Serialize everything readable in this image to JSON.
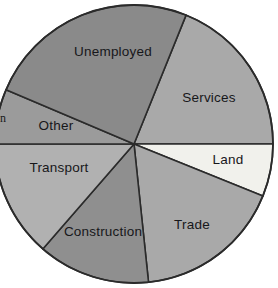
{
  "chart_data": {
    "type": "pie",
    "title": "",
    "subtitle": "",
    "xlabel": "",
    "ylabel": "",
    "legend_position": "none",
    "grid": false,
    "labels_on_slices": true,
    "categories": [
      "Services",
      "Land",
      "Trade",
      "Construction",
      "Transport",
      "Other",
      "Unemployed"
    ],
    "values": [
      19,
      6,
      17,
      13,
      14,
      6,
      25
    ],
    "units": "percent",
    "slices": [
      {
        "label": "Services",
        "value": 19,
        "color": "#a9a9a9",
        "start_angle_deg": -68,
        "end_angle_deg": 0,
        "label_x": 209,
        "label_y": 98
      },
      {
        "label": "Land",
        "value": 6,
        "color": "#f1f1ec",
        "start_angle_deg": 0,
        "end_angle_deg": 22,
        "label_x": 228,
        "label_y": 160
      },
      {
        "label": "Trade",
        "value": 17,
        "color": "#a9a9a9",
        "start_angle_deg": 22,
        "end_angle_deg": 84,
        "label_x": 192,
        "label_y": 225
      },
      {
        "label": "Construction",
        "value": 13,
        "color": "#8f8f8f",
        "start_angle_deg": 84,
        "end_angle_deg": 131,
        "label_x": 103,
        "label_y": 232
      },
      {
        "label": "Transport",
        "value": 14,
        "color": "#b1b1b1",
        "start_angle_deg": 131,
        "end_angle_deg": 180,
        "label_x": 59,
        "label_y": 168
      },
      {
        "label": "Other",
        "value": 6,
        "color": "#9b9b9b",
        "start_angle_deg": 180,
        "end_angle_deg": 203,
        "label_x": 56,
        "label_y": 126
      },
      {
        "label": "Unemployed",
        "value": 25,
        "color": "#8a8a8a",
        "start_angle_deg": 203,
        "end_angle_deg": 292,
        "label_x": 113,
        "label_y": 52
      }
    ],
    "geometry": {
      "center_x": 134,
      "center_y": 144,
      "radius": 139
    },
    "outline_color": "#2b2b2b",
    "background_color": "#ffffff"
  },
  "margin_note": {
    "text": "n"
  }
}
